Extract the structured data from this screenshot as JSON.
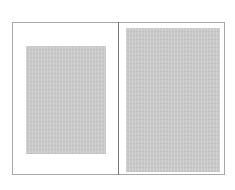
{
  "diagram": {
    "type": "book-spread-page-layout",
    "pages": [
      {
        "side": "left",
        "text_block": "smaller, centered with wide margins"
      },
      {
        "side": "right",
        "text_block": "larger, narrow margins"
      }
    ],
    "colors": {
      "page_border": "#a8a8a8",
      "gutter": "#777777",
      "text_block": "#c9c9c9",
      "background": "#ffffff"
    }
  }
}
